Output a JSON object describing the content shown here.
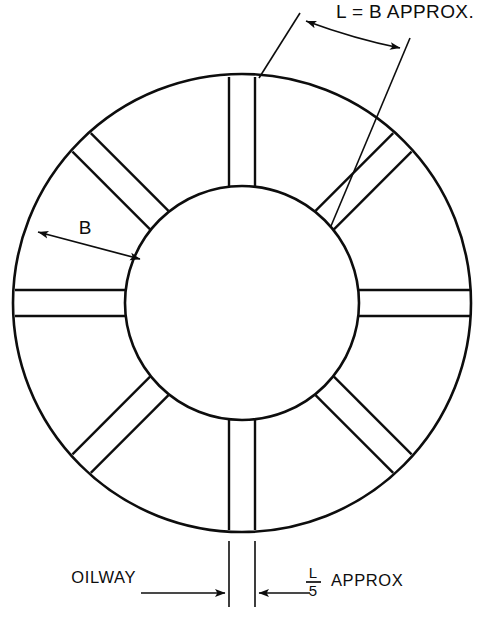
{
  "figure": {
    "kind": "engineering-drawing",
    "background_color": "#ffffff",
    "line_color": "#0d0d0d"
  },
  "geometry": {
    "center_x": 242,
    "center_y": 303,
    "outer_radius": 229,
    "inner_radius": 117,
    "oilway_count": 8,
    "oilway_angles_deg": [
      0,
      45,
      90,
      135,
      180,
      225,
      270,
      315
    ],
    "oilway_half_width": 13
  },
  "labels": {
    "arc_dimension": "L = B APPROX.",
    "radial_dimension": "B",
    "oilway_callout": "OILWAY",
    "width_numerator": "L",
    "width_denominator": "5",
    "width_suffix": "APPROX"
  }
}
